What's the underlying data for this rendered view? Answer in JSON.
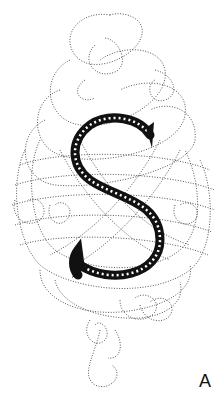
{
  "figure": {
    "initial_letter": "S",
    "panel_label": "A",
    "colors": {
      "background": "#ffffff",
      "letter": "#111111",
      "flourish": "#555555"
    }
  }
}
